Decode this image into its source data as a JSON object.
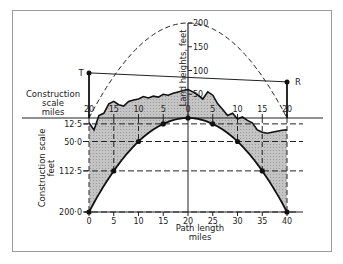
{
  "chart_data": {
    "type": "diagram",
    "title": "",
    "labels": {
      "construction_scale_miles": [
        "Construction",
        "scale",
        "miles"
      ],
      "construction_scale_feet": [
        "Construction scale",
        "feet"
      ],
      "land_heights": "Land heights, feet",
      "path_length": [
        "Path length",
        "miles"
      ],
      "transmitter": "T",
      "receiver": "R"
    },
    "top_scale_ticks": [
      "20",
      "15",
      "10",
      "5",
      "0",
      "5",
      "10",
      "15",
      "20"
    ],
    "top_scale_values": [
      -20,
      -15,
      -10,
      -5,
      0,
      5,
      10,
      15,
      20
    ],
    "land_height_ticks": [
      "50",
      "100",
      "150",
      "200"
    ],
    "land_height_values": [
      50,
      100,
      150,
      200
    ],
    "construction_feet_ticks": [
      "12·5",
      "50·0",
      "112·5",
      "200·0"
    ],
    "construction_feet_values": [
      12.5,
      50.0,
      112.5,
      200.0
    ],
    "path_length_ticks": [
      "0",
      "5",
      "10",
      "15",
      "20",
      "25",
      "30",
      "35",
      "40"
    ],
    "path_length_values": [
      0,
      5,
      10,
      15,
      20,
      25,
      30,
      35,
      40
    ],
    "earth_curve_points": [
      {
        "x": 0,
        "drop": 200.0
      },
      {
        "x": 5,
        "drop": 112.5
      },
      {
        "x": 10,
        "drop": 50.0
      },
      {
        "x": 15,
        "drop": 12.5
      },
      {
        "x": 20,
        "drop": 0
      },
      {
        "x": 25,
        "drop": 12.5
      },
      {
        "x": 30,
        "drop": 50.0
      },
      {
        "x": 35,
        "drop": 112.5
      },
      {
        "x": 40,
        "drop": 200.0
      }
    ],
    "terrain_profile": [
      {
        "x": 0,
        "h": -10
      },
      {
        "x": 1,
        "h": -25
      },
      {
        "x": 2,
        "h": 5
      },
      {
        "x": 3,
        "h": 10
      },
      {
        "x": 4,
        "h": 30
      },
      {
        "x": 5,
        "h": 35
      },
      {
        "x": 6,
        "h": 28
      },
      {
        "x": 7,
        "h": 25
      },
      {
        "x": 8,
        "h": 35
      },
      {
        "x": 9,
        "h": 38
      },
      {
        "x": 10,
        "h": 40
      },
      {
        "x": 11,
        "h": 45
      },
      {
        "x": 12,
        "h": 42
      },
      {
        "x": 13,
        "h": 46
      },
      {
        "x": 14,
        "h": 44
      },
      {
        "x": 15,
        "h": 50
      },
      {
        "x": 16,
        "h": 48
      },
      {
        "x": 17,
        "h": 52
      },
      {
        "x": 18,
        "h": 55
      },
      {
        "x": 19,
        "h": 58
      },
      {
        "x": 20,
        "h": 60
      },
      {
        "x": 21,
        "h": 55
      },
      {
        "x": 22,
        "h": 48
      },
      {
        "x": 23,
        "h": 40
      },
      {
        "x": 24,
        "h": 55
      },
      {
        "x": 25,
        "h": 48
      },
      {
        "x": 26,
        "h": 30
      },
      {
        "x": 27,
        "h": 18
      },
      {
        "x": 28,
        "h": 5
      },
      {
        "x": 29,
        "h": 10
      },
      {
        "x": 30,
        "h": -2
      },
      {
        "x": 31,
        "h": 2
      },
      {
        "x": 32,
        "h": -5
      },
      {
        "x": 33,
        "h": -10
      },
      {
        "x": 34,
        "h": -25
      },
      {
        "x": 35,
        "h": -30
      },
      {
        "x": 36,
        "h": -32
      },
      {
        "x": 37,
        "h": -30
      },
      {
        "x": 38,
        "h": -28
      },
      {
        "x": 39,
        "h": -26
      },
      {
        "x": 40,
        "h": -25
      }
    ],
    "transmitter": {
      "x": 0,
      "height": 95
    },
    "receiver": {
      "x": 40,
      "height": 76
    },
    "clearance_parabola_peak": 200
  }
}
